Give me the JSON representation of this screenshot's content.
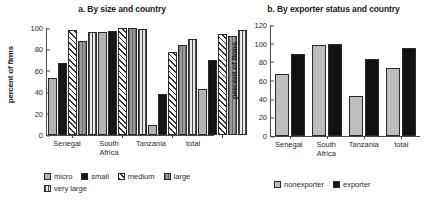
{
  "chart_data": [
    {
      "type": "bar",
      "id": "panel-a",
      "title": "a. By size and country",
      "xlabel": "",
      "ylabel": "percent of firms",
      "ylim": [
        0,
        100
      ],
      "yticks": [
        0,
        20,
        40,
        60,
        80,
        100
      ],
      "grid": false,
      "legend_position": "bottom",
      "categories": [
        "Senegal",
        "South\nAfrica",
        "Tanzania",
        "total"
      ],
      "series": [
        {
          "name": "micro",
          "fill": "light-gray",
          "values": [
            53,
            96,
            9,
            43
          ]
        },
        {
          "name": "small",
          "fill": "black",
          "values": [
            67,
            97,
            38,
            70
          ]
        },
        {
          "name": "medium",
          "fill": "diagonal-hatch",
          "values": [
            98,
            100,
            78,
            94
          ]
        },
        {
          "name": "large",
          "fill": "gray-vertical-lines",
          "values": [
            88,
            100,
            84,
            93
          ]
        },
        {
          "name": "very large",
          "fill": "light-vertical-lines",
          "values": [
            96,
            99,
            90,
            98
          ]
        }
      ]
    },
    {
      "type": "bar",
      "id": "panel-b",
      "title": "b. By exporter status and country",
      "xlabel": "",
      "ylabel": "percent of firms",
      "ylim": [
        0,
        120
      ],
      "yticks": [
        0,
        20,
        40,
        60,
        80,
        100,
        120
      ],
      "grid": false,
      "legend_position": "bottom",
      "categories": [
        "Senegal",
        "South\nAfrica",
        "Tanzania",
        "total"
      ],
      "series": [
        {
          "name": "nonexporter",
          "fill": "light-gray",
          "values": [
            67,
            98,
            43,
            74
          ]
        },
        {
          "name": "exporter",
          "fill": "black",
          "values": [
            89,
            99,
            83,
            95
          ]
        }
      ]
    }
  ],
  "panel_a": {
    "title": "a. By size and country",
    "ylabel": "percent of firms",
    "yticks": [
      "100",
      "80",
      "60",
      "40",
      "20",
      "0"
    ],
    "xlabels": [
      "Senegal",
      "South\nAfrica",
      "Tanzania",
      "total"
    ],
    "legend": [
      "micro",
      "small",
      "medium",
      "large",
      "very large"
    ]
  },
  "panel_b": {
    "title": "b. By exporter status and country",
    "ylabel": "percent of firms",
    "yticks": [
      "120",
      "100",
      "80",
      "60",
      "40",
      "20",
      "0"
    ],
    "xlabels": [
      "Senegal",
      "South\nAfrica",
      "Tanzania",
      "total"
    ],
    "legend": [
      "nonexporter",
      "exporter"
    ]
  }
}
